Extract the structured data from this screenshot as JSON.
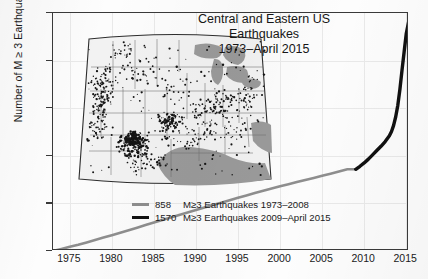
{
  "chart_data": {
    "type": "line",
    "title": "Central and Eastern US Earthquakes 1973–April 2015",
    "title_lines": [
      "Central and Eastern US",
      "Earthquakes",
      "1973–April 2015"
    ],
    "xlabel": "",
    "ylabel": "Number of M ≥ 3 Earthquakes",
    "xlim": [
      1973,
      2015.33
    ],
    "ylim": [
      0,
      2500
    ],
    "xticks": [
      1975,
      1980,
      1985,
      1990,
      1995,
      2000,
      2005,
      2010,
      2015
    ],
    "yticks": [
      0,
      500,
      1000,
      1500,
      2000,
      2500
    ],
    "grid": true,
    "legend_position": "lower center-right",
    "series": [
      {
        "name": "858   M≥3 Earthquakes 1973–2008",
        "count": "858",
        "label": "M≥3 Earthquakes 1973–2008",
        "color": "#8e8e8e",
        "x": [
          1973.0,
          1974.0,
          1975.0,
          1976.0,
          1977.0,
          1978.0,
          1979.0,
          1980.0,
          1981.0,
          1982.0,
          1983.0,
          1984.0,
          1985.0,
          1986.0,
          1987.0,
          1988.0,
          1989.0,
          1990.0,
          1991.0,
          1992.0,
          1993.0,
          1994.0,
          1995.0,
          1996.0,
          1997.0,
          1998.0,
          1999.0,
          2000.0,
          2001.0,
          2002.0,
          2003.0,
          2004.0,
          2005.0,
          2006.0,
          2007.0,
          2008.0,
          2009.0
        ],
        "y": [
          0,
          22,
          44,
          66,
          90,
          116,
          142,
          166,
          192,
          218,
          244,
          272,
          300,
          326,
          352,
          378,
          404,
          430,
          456,
          482,
          508,
          534,
          560,
          584,
          608,
          632,
          656,
          680,
          702,
          724,
          746,
          768,
          790,
          812,
          835,
          858,
          858
        ]
      },
      {
        "name": "1570   M≥3 Earthquakes 2009–April 2015",
        "count": "1570",
        "label": "M≥3 Earthquakes 2009–April 2015",
        "color": "#111111",
        "x": [
          2009.0,
          2009.5,
          2010.0,
          2010.5,
          2011.0,
          2011.5,
          2012.0,
          2012.5,
          2013.0,
          2013.25,
          2013.5,
          2013.75,
          2014.0,
          2014.25,
          2014.5,
          2014.75,
          2015.0,
          2015.33
        ],
        "y": [
          858,
          890,
          925,
          965,
          1010,
          1055,
          1100,
          1150,
          1210,
          1255,
          1320,
          1410,
          1530,
          1700,
          1900,
          2090,
          2280,
          2428
        ]
      }
    ],
    "total": 2428,
    "annotations": []
  },
  "yaxis": {
    "label": "Number of M ≥ 3 Earthquakes",
    "ticks": [
      "2500",
      "2000",
      "1500",
      "1000",
      "500",
      "0"
    ]
  },
  "xaxis": {
    "ticks": [
      "1975",
      "1980",
      "1985",
      "1990",
      "1995",
      "2000",
      "2005",
      "2010",
      "2015"
    ]
  },
  "title": {
    "line1": "Central and Eastern US",
    "line2": "Earthquakes",
    "line3": "1973–April 2015"
  },
  "legend": {
    "items": [
      {
        "count": "858",
        "text": "M≥3 Earthquakes 1973–2008",
        "color": "#8e8e8e"
      },
      {
        "count": "1570",
        "text": "M≥3 Earthquakes 2009–April 2015",
        "color": "#111111"
      }
    ]
  },
  "map_inset": {
    "name": "central-and-eastern-us-epicenter-map",
    "water_color": "#9a9a9a",
    "land_color": "#f2f2f2",
    "epicenter_color": "#151515"
  }
}
